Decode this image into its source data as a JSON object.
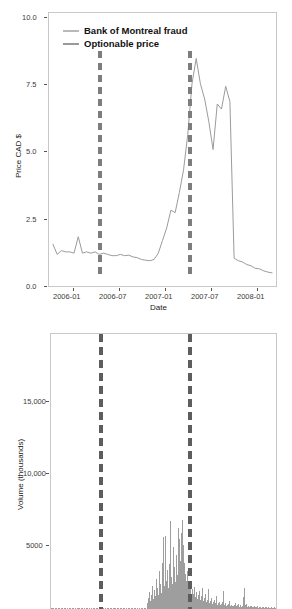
{
  "figure": {
    "background": "#ffffff",
    "panel_border_color": "#c9c9c9"
  },
  "legend": {
    "position": "top-left-inside-panel",
    "items": [
      {
        "label": "Bank of Montreal fraud",
        "color": "#b9b9b9",
        "style": "line"
      },
      {
        "label": "Optionable price",
        "color": "#9a9a9a",
        "style": "line"
      }
    ]
  },
  "chart_data": [
    {
      "id": "price-panel",
      "type": "line",
      "title": "",
      "xlabel": "Date",
      "ylabel": "Price CAD $",
      "grid": false,
      "legend_position": "top-left",
      "xlim": [
        "2005-11-01",
        "2008-04-01"
      ],
      "ylim": [
        -0.4,
        10.4
      ],
      "xticks": [
        "2006-01",
        "2006-07",
        "2007-01",
        "2007-07",
        "2008-01"
      ],
      "yticks": [
        "0.0",
        "2.5",
        "5.0",
        "7.5",
        "10.0"
      ],
      "ytick_values": [
        0.0,
        2.5,
        5.0,
        7.5,
        10.0
      ],
      "series": [
        {
          "name": "Optionable price",
          "color": "#9a9a9a",
          "x": [
            "2005-11",
            "2005-11",
            "2005-12",
            "2005-12",
            "2006-01",
            "2006-01",
            "2006-02",
            "2006-02",
            "2006-02",
            "2006-03",
            "2006-03",
            "2006-04",
            "2006-04",
            "2006-05",
            "2006-05",
            "2006-06",
            "2006-06",
            "2006-07",
            "2006-07",
            "2006-08",
            "2006-08",
            "2006-09",
            "2006-09",
            "2006-10",
            "2006-10",
            "2006-11",
            "2006-11",
            "2006-12",
            "2006-12",
            "2007-01",
            "2007-01",
            "2007-01",
            "2007-02",
            "2007-02",
            "2007-02",
            "2007-03",
            "2007-03",
            "2007-04",
            "2007-04",
            "2007-04",
            "2007-05",
            "2007-05",
            "2007-05",
            "2007-06",
            "2007-07",
            "2007-08",
            "2007-09",
            "2007-10",
            "2007-11",
            "2007-12",
            "2008-01",
            "2008-02",
            "2008-03"
          ],
          "values": [
            1.25,
            0.85,
            1.0,
            0.95,
            0.95,
            0.9,
            1.55,
            0.9,
            0.95,
            0.9,
            0.95,
            0.85,
            0.9,
            0.85,
            0.8,
            0.8,
            0.85,
            0.8,
            0.82,
            0.75,
            0.72,
            0.65,
            0.62,
            0.6,
            0.65,
            0.9,
            1.4,
            1.9,
            2.6,
            2.5,
            3.3,
            4.2,
            5.6,
            7.6,
            8.6,
            7.6,
            7.0,
            6.1,
            5.0,
            6.8,
            6.6,
            7.5,
            6.9,
            0.7,
            0.6,
            0.55,
            0.45,
            0.4,
            0.3,
            0.28,
            0.2,
            0.15,
            0.12
          ]
        }
      ],
      "annotations": [
        {
          "name": "Bank of Montreal fraud",
          "type": "vline",
          "x": "2006-06-20",
          "style": "dashed",
          "color": "#7d7d7d"
        },
        {
          "name": "Optionable halt",
          "type": "vline",
          "x": "2007-05-10",
          "style": "dashed",
          "color": "#7d7d7d"
        }
      ]
    },
    {
      "id": "volume-panel",
      "type": "bar",
      "title": "",
      "xlabel": "",
      "ylabel": "Volume (thousands)",
      "grid": false,
      "xlim": [
        "2005-11-01",
        "2008-04-01"
      ],
      "ylim": [
        0,
        19000
      ],
      "yticks": [
        "5000",
        "10,000",
        "15,000"
      ],
      "ytick_values": [
        5000,
        10000,
        15000
      ],
      "bar_color": "#9e9e9e",
      "note": "x-axis tick labels cropped off bottom of image",
      "values": [
        60,
        40,
        55,
        30,
        45,
        70,
        35,
        50,
        40,
        30,
        55,
        45,
        35,
        50,
        40,
        60,
        35,
        45,
        30,
        55,
        40,
        35,
        50,
        45,
        30,
        40,
        35,
        55,
        45,
        60,
        35,
        40,
        50,
        30,
        45,
        35,
        55,
        40,
        30,
        50,
        45,
        35,
        40,
        30,
        55,
        45,
        35,
        50,
        40,
        30,
        45,
        35,
        55,
        40,
        50,
        30,
        45,
        35,
        40,
        55,
        30,
        45,
        50,
        35,
        40,
        30,
        55,
        45,
        35,
        50,
        40,
        30,
        45,
        55,
        35,
        40,
        50,
        30,
        45,
        35,
        55,
        40,
        30,
        50,
        45,
        35,
        40,
        55,
        30,
        45,
        35,
        50,
        40,
        30,
        55,
        45,
        35,
        40,
        50,
        30,
        420,
        760,
        1180,
        540,
        980,
        1560,
        720,
        1340,
        900,
        2100,
        1450,
        980,
        2600,
        1750,
        1100,
        3200,
        4950,
        1600,
        2450,
        5050,
        1900,
        2700,
        1450,
        3100,
        6050,
        2200,
        1700,
        4250,
        2900,
        1850,
        3750,
        2350,
        5600,
        4800,
        3300,
        5200,
        6100,
        4400,
        3150,
        2400,
        1900,
        2600,
        1450,
        1750,
        1200,
        1600,
        900,
        1350,
        1050,
        1500,
        820,
        1180,
        700,
        950,
        1250,
        640,
        880,
        1480,
        560,
        740,
        1020,
        480,
        620,
        1350,
        420,
        560,
        790,
        370,
        480,
        640,
        320,
        430,
        880,
        290,
        380,
        510,
        260,
        340,
        450,
        1240,
        300,
        390,
        220,
        290,
        370,
        560,
        240,
        310,
        180,
        230,
        300,
        420,
        200,
        260,
        340,
        170,
        220,
        280,
        150,
        190,
        820,
        1420,
        260,
        330,
        170,
        210,
        140,
        180,
        230,
        120,
        160,
        200,
        110,
        150,
        190,
        100,
        130,
        170,
        90,
        120,
        160,
        85,
        110,
        140,
        80,
        100,
        130,
        75,
        95,
        120,
        70,
        90,
        115,
        65,
        85,
        110
      ]
    }
  ]
}
